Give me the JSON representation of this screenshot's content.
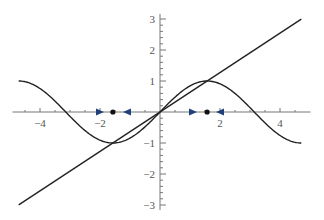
{
  "chart_data": {
    "type": "line",
    "title": "",
    "xlabel": "",
    "ylabel": "",
    "xlim": [
      -4.75,
      4.75
    ],
    "ylim": [
      -3.1,
      3.1
    ],
    "grid": false,
    "legend": null,
    "x_ticks": [
      -4,
      -2,
      2,
      4
    ],
    "x_tick_labels": [
      "-4",
      "-2",
      "2",
      "4"
    ],
    "y_ticks": [
      -3,
      -2,
      -1,
      1,
      2,
      3
    ],
    "y_tick_labels": [
      "-3",
      "-2",
      "-1",
      "1",
      "2",
      "3"
    ],
    "series": [
      {
        "name": "sin(x)",
        "function": "sin(x)",
        "x_range": [
          -4.71,
          4.71
        ],
        "color": "#222222"
      },
      {
        "name": "line y = 2x/π",
        "function": "(2/pi)*x",
        "x_range": [
          -4.71,
          4.71
        ],
        "color": "#222222"
      }
    ],
    "fixed_points": [
      {
        "x": -1.5708,
        "y": 0,
        "type": "stable",
        "color": "#111111"
      },
      {
        "x": 1.5708,
        "y": 0,
        "type": "stable",
        "color": "#111111"
      }
    ],
    "flow_arrows": [
      {
        "x": -2.0,
        "direction": "right",
        "color": "#1f3f7a"
      },
      {
        "x": -1.1,
        "direction": "left",
        "color": "#1f3f7a"
      },
      {
        "x": 1.1,
        "direction": "right",
        "color": "#1f3f7a"
      },
      {
        "x": 2.0,
        "direction": "left",
        "color": "#1f3f7a"
      }
    ],
    "intersections": [
      {
        "x": -1.5708,
        "y": -1
      },
      {
        "x": 0,
        "y": 0
      },
      {
        "x": 1.5708,
        "y": 1
      }
    ]
  },
  "layout": {
    "origin_px": [
      160,
      112
    ],
    "x_unit_px": 30,
    "y_unit_px": 31
  }
}
